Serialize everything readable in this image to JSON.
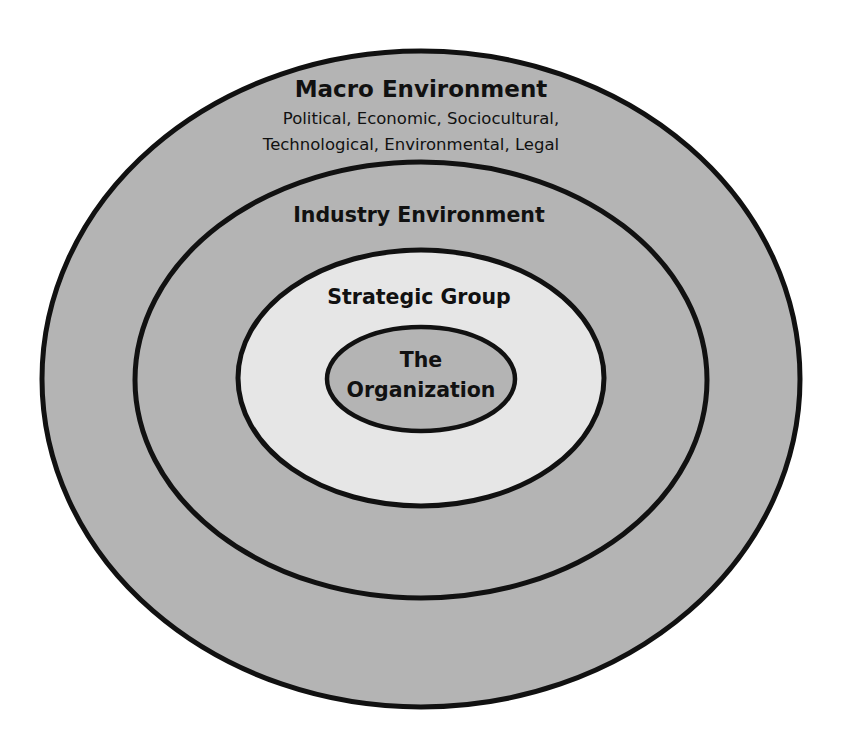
{
  "diagram": {
    "type": "nested-ellipses",
    "colors": {
      "outer_fill": "#b4b4b4",
      "industry_fill": "#b4b4b4",
      "strategic_fill": "#e6e6e6",
      "organization_fill": "#b4b4b4",
      "stroke": "#111111"
    },
    "layers": {
      "macro": {
        "title": "Macro Environment",
        "subtitle_line1": "Political, Economic, Sociocultural,",
        "subtitle_line2": "Technological, Environmental, Legal"
      },
      "industry": {
        "title": "Industry Environment"
      },
      "strategic": {
        "title": "Strategic Group"
      },
      "organization": {
        "title_line1": "The",
        "title_line2": "Organization"
      }
    }
  }
}
